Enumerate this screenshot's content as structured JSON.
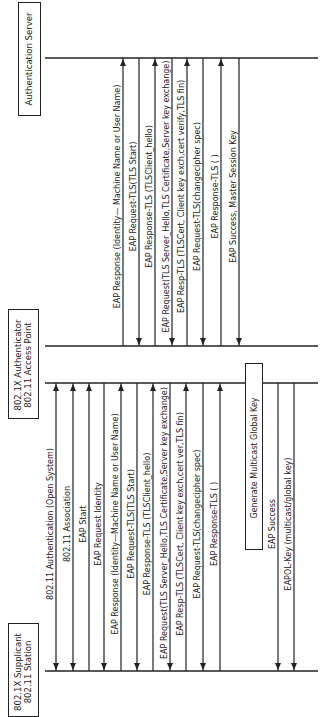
{
  "diagram": {
    "type": "sequence",
    "orientation": "rotated-90-ccw",
    "line_color": "#222222",
    "entities": [
      {
        "id": "server",
        "lines": [
          "Authentication Server"
        ]
      },
      {
        "id": "authenticator",
        "lines": [
          "802.1X Authenticator",
          "802.11 Access Point"
        ]
      },
      {
        "id": "supplicant",
        "lines": [
          "802.1X Supplicant",
          "802.11 Station"
        ]
      }
    ],
    "station_ap_messages": [
      {
        "label": "802.11 Authentication (Open System)",
        "direction": "both"
      },
      {
        "label": "802.11 Association",
        "direction": "both"
      },
      {
        "label": "EAP Start",
        "direction": "to_ap"
      },
      {
        "label": "EAP Request Identity",
        "direction": "to_station"
      },
      {
        "label": "EAP Response (Identity—Machine Name or User Name)",
        "direction": "to_ap"
      },
      {
        "label": "EAP Request-TLS(TLS Start)",
        "direction": "to_station"
      },
      {
        "label": "EAP Response-TLS (TLSClient_hello)",
        "direction": "to_ap"
      },
      {
        "label": "EAP Request(TLS Server_Hello,TLS Certificate,Server key exchange)",
        "direction": "to_station"
      },
      {
        "label": "EAP Resp-TLS (TLSCert, Client key exch,cert ver,TLS fin)",
        "direction": "to_ap"
      },
      {
        "label": "EAP Request-TLS(changecipher spec)",
        "direction": "to_station"
      },
      {
        "label": "EAP Response-TLS ( )",
        "direction": "to_ap"
      },
      {
        "label": "EAP Success",
        "direction": "to_station"
      },
      {
        "label": "EAPOL-Key (multicast/global key)",
        "direction": "to_station"
      }
    ],
    "ap_server_messages": [
      {
        "label": "EAP Response (Identity— Machine Name or User Name)",
        "direction": "to_server"
      },
      {
        "label": "EAP Request-TLS(TLS Start)",
        "direction": "to_ap"
      },
      {
        "label": "EAP Response-TLS (TLSClient_hello)",
        "direction": "to_server"
      },
      {
        "label": "EAP Request(TLS Server_Hello,TLS Certificate,Server key exchange)",
        "direction": "to_ap"
      },
      {
        "label": "EAP Resp-TLS (TLSCert, Client key exch,cert verify,TLS fin)",
        "direction": "to_server"
      },
      {
        "label": "EAP Request-TLS(changecipher spec)",
        "direction": "to_ap"
      },
      {
        "label": "EAP Response-TLS ( )",
        "direction": "to_server"
      },
      {
        "label": "EAP Success, Master Session Key",
        "direction": "to_ap"
      }
    ],
    "process_box": {
      "label": "Generate Multicast Global Key"
    }
  }
}
